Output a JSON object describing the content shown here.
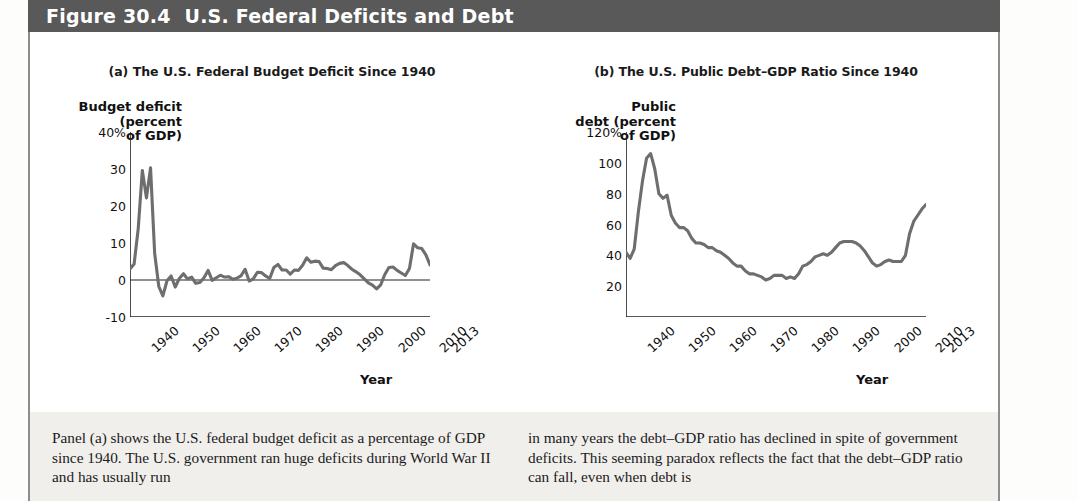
{
  "header": {
    "figure_number": "Figure 30.4",
    "title": "U.S. Federal Deficits and Debt"
  },
  "panel_a": {
    "title": "(a) The U.S. Federal Budget Deficit Since 1940",
    "ylabel": "Budget deficit\n(percent\nof GDP)",
    "xlabel": "Year",
    "yticks": [
      "40%",
      "30",
      "20",
      "10",
      "0",
      "-10"
    ],
    "xticks": [
      "1940",
      "1950",
      "1960",
      "1970",
      "1980",
      "1990",
      "2000",
      "2010",
      "2013"
    ]
  },
  "panel_b": {
    "title": "(b) The U.S. Public Debt–GDP Ratio Since 1940",
    "ylabel": "Public\ndebt (percent\nof GDP)",
    "xlabel": "Year",
    "yticks": [
      "120%",
      "100",
      "80",
      "60",
      "40",
      "20"
    ],
    "xticks": [
      "1940",
      "1950",
      "1960",
      "1970",
      "1980",
      "1990",
      "2000",
      "2010",
      "2013"
    ]
  },
  "caption": {
    "left": "Panel (a) shows the U.S. federal budget deficit as a percentage of GDP since 1940. The U.S. government ran huge deficits during World War II and has usually run",
    "right": "in many years the debt–GDP ratio has declined in spite of government deficits. This seeming paradox reflects the fact that the debt–GDP ratio can fall, even when debt is"
  },
  "colors": {
    "header_bar": "#595959",
    "line": "#6e6e6e",
    "axis": "#222222",
    "caption_bg": "#f1efec"
  },
  "chart_data": [
    {
      "type": "line",
      "id": "panel-a",
      "title": "(a) The U.S. Federal Budget Deficit Since 1940",
      "xlabel": "Year",
      "ylabel": "Budget deficit (percent of GDP)",
      "xlim": [
        1940,
        2013
      ],
      "ylim": [
        -10,
        40
      ],
      "yticks": [
        -10,
        0,
        10,
        20,
        30,
        40
      ],
      "xticks": [
        1940,
        1950,
        1960,
        1970,
        1980,
        1990,
        2000,
        2010,
        2013
      ],
      "grid": false,
      "legend": "none",
      "x": [
        1940,
        1941,
        1942,
        1943,
        1944,
        1945,
        1946,
        1947,
        1948,
        1949,
        1950,
        1951,
        1952,
        1953,
        1954,
        1955,
        1956,
        1957,
        1958,
        1959,
        1960,
        1961,
        1962,
        1963,
        1964,
        1965,
        1966,
        1967,
        1968,
        1969,
        1970,
        1971,
        1972,
        1973,
        1974,
        1975,
        1976,
        1977,
        1978,
        1979,
        1980,
        1981,
        1982,
        1983,
        1984,
        1985,
        1986,
        1987,
        1988,
        1989,
        1990,
        1991,
        1992,
        1993,
        1994,
        1995,
        1996,
        1997,
        1998,
        1999,
        2000,
        2001,
        2002,
        2003,
        2004,
        2005,
        2006,
        2007,
        2008,
        2009,
        2010,
        2011,
        2012,
        2013
      ],
      "values": [
        3.0,
        4.3,
        13.9,
        29.6,
        22.2,
        30.3,
        7.2,
        -1.7,
        -4.3,
        -0.2,
        1.1,
        -1.9,
        0.4,
        1.7,
        0.3,
        0.8,
        -0.9,
        -0.7,
        0.6,
        2.6,
        -0.1,
        0.6,
        1.3,
        0.8,
        0.9,
        0.2,
        0.5,
        1.1,
        2.9,
        -0.3,
        0.3,
        2.1,
        2.0,
        1.1,
        0.4,
        3.4,
        4.2,
        2.7,
        2.7,
        1.6,
        2.7,
        2.6,
        4.0,
        6.0,
        4.8,
        5.1,
        5.0,
        3.2,
        3.1,
        2.8,
        3.9,
        4.5,
        4.7,
        3.9,
        2.9,
        2.2,
        1.4,
        0.3,
        -0.8,
        -1.4,
        -2.4,
        -1.3,
        1.5,
        3.4,
        3.5,
        2.6,
        1.9,
        1.2,
        3.1,
        9.8,
        8.7,
        8.5,
        6.8,
        4.1
      ]
    },
    {
      "type": "line",
      "id": "panel-b",
      "title": "(b) The U.S. Public Debt–GDP Ratio Since 1940",
      "xlabel": "Year",
      "ylabel": "Public debt (percent of GDP)",
      "xlim": [
        1940,
        2013
      ],
      "ylim": [
        0,
        120
      ],
      "yticks": [
        20,
        40,
        60,
        80,
        100,
        120
      ],
      "xticks": [
        1940,
        1950,
        1960,
        1970,
        1980,
        1990,
        2000,
        2010,
        2013
      ],
      "grid": false,
      "legend": "none",
      "x": [
        1940,
        1941,
        1942,
        1943,
        1944,
        1945,
        1946,
        1947,
        1948,
        1949,
        1950,
        1951,
        1952,
        1953,
        1954,
        1955,
        1956,
        1957,
        1958,
        1959,
        1960,
        1961,
        1962,
        1963,
        1964,
        1965,
        1966,
        1967,
        1968,
        1969,
        1970,
        1971,
        1972,
        1973,
        1974,
        1975,
        1976,
        1977,
        1978,
        1979,
        1980,
        1981,
        1982,
        1983,
        1984,
        1985,
        1986,
        1987,
        1988,
        1989,
        1990,
        1991,
        1992,
        1993,
        1994,
        1995,
        1996,
        1997,
        1998,
        1999,
        2000,
        2001,
        2002,
        2003,
        2004,
        2005,
        2006,
        2007,
        2008,
        2009,
        2010,
        2011,
        2012,
        2013
      ],
      "values": [
        42.0,
        38.0,
        44.0,
        68.0,
        88.0,
        103.0,
        106.0,
        96.0,
        80.0,
        77.0,
        79.0,
        66.0,
        61.0,
        58.0,
        58.0,
        56.0,
        51.0,
        48.0,
        48.0,
        47.0,
        45.0,
        45.0,
        43.0,
        42.0,
        40.0,
        38.0,
        35.0,
        33.0,
        33.0,
        30.0,
        28.0,
        28.0,
        27.0,
        26.0,
        24.0,
        25.0,
        27.0,
        27.0,
        27.0,
        25.0,
        26.0,
        25.0,
        28.0,
        33.0,
        34.0,
        36.0,
        39.0,
        40.0,
        41.0,
        40.0,
        42.0,
        45.0,
        48.0,
        49.0,
        49.0,
        49.0,
        48.0,
        46.0,
        43.0,
        39.0,
        35.0,
        33.0,
        34.0,
        36.0,
        37.0,
        36.0,
        36.0,
        36.0,
        40.0,
        54.0,
        62.0,
        66.0,
        70.0,
        73.0
      ]
    }
  ]
}
